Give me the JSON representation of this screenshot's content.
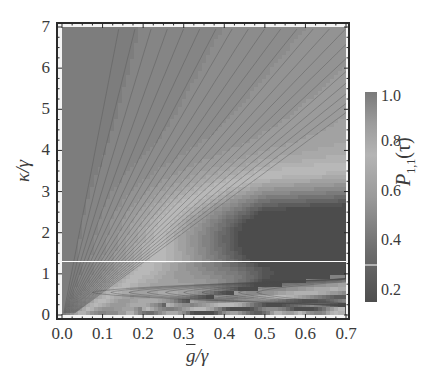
{
  "chart_data": {
    "type": "heatmap",
    "subtype": "contour",
    "title": "",
    "xlabel": "ḡ/γ",
    "ylabel": "κ/γ",
    "colorbar_label": "P_{1,1}(τ)",
    "xlim": [
      0.0,
      0.7
    ],
    "ylim": [
      0,
      7
    ],
    "x_ticks": [
      "0.0",
      "0.1",
      "0.2",
      "0.3",
      "0.4",
      "0.5",
      "0.6",
      "0.7"
    ],
    "y_ticks": [
      "0",
      "1",
      "2",
      "3",
      "4",
      "5",
      "6",
      "7"
    ],
    "colorbar_ticks": [
      "0.2",
      "0.4",
      "0.6",
      "0.8",
      "1.0"
    ],
    "colorbar_range": [
      0.15,
      1.0
    ],
    "colormap": "grayscale (dark = low, light = mid, dark-gray = high)",
    "annotations": [
      {
        "type": "horizontal_line",
        "y": 1.3,
        "color": "#ffffff"
      }
    ],
    "features": [
      {
        "region": "x≈0–0.1, all κ",
        "description": "dark uniform wedge, P≈1"
      },
      {
        "region": "fan of contours radiating from origin",
        "description": "levels increase with ḡ/κ"
      },
      {
        "region": "x≈0.4–0.7, κ≈1.3–3.5",
        "description": "dark valley minimum, P≈0.2"
      },
      {
        "region": "κ<1",
        "description": "oscillatory closed contours, lighter band"
      }
    ],
    "grid": false,
    "legend_position": "right (colorbar)"
  },
  "axes": {
    "x_title_main": "g",
    "x_title_rest": "/γ",
    "y_title": "κ/γ",
    "cb_title_main": "P",
    "cb_title_sub": "1,1",
    "cb_title_arg": "(τ)"
  },
  "colors": {
    "frame": "#2a2a2a",
    "white_line": "#ffffff",
    "dark": "#5a5a5a",
    "mid": "#a8a8a8",
    "light": "#c8c8c8"
  }
}
